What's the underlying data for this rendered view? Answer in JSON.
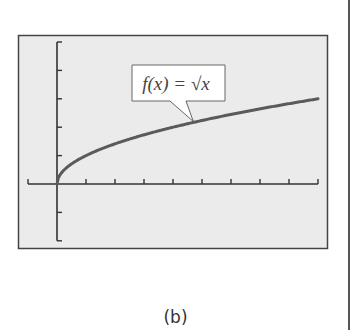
{
  "chart_data": {
    "type": "line",
    "title": "",
    "function_label": "f(x) = √x",
    "xlabel": "",
    "ylabel": "",
    "xlim": [
      -1,
      9
    ],
    "ylim": [
      -2,
      5
    ],
    "x_ticks": [
      -1,
      0,
      1,
      2,
      3,
      4,
      5,
      6,
      7,
      8,
      9
    ],
    "y_ticks": [
      -2,
      -1,
      0,
      1,
      2,
      3,
      4,
      5
    ],
    "tick_labels_shown": false,
    "grid": false,
    "legend": "none",
    "series": [
      {
        "name": "f(x) = √x",
        "x": [
          0,
          0.25,
          0.5,
          1,
          2,
          3,
          4,
          5,
          6,
          7,
          8,
          9
        ],
        "y": [
          0,
          0.5,
          0.707,
          1,
          1.414,
          1.732,
          2,
          2.236,
          2.449,
          2.646,
          2.828,
          3
        ]
      }
    ],
    "annotation": {
      "text": "f(x) = √x",
      "type": "callout",
      "points_to_x": 4.7
    }
  },
  "caption": "(b)",
  "colors": {
    "frame_bg": "#ebebeb",
    "frame_border": "#444444",
    "axis": "#333333",
    "curve": "#5a5a5a",
    "callout_bg": "#ffffff"
  }
}
